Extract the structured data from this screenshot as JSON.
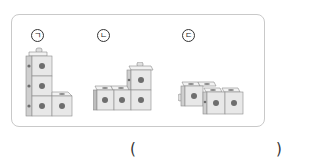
{
  "figures": [
    {
      "label": "ㄱ",
      "description": "L-shaped stack: 3 cubes vertical with 1 cube to the right at bottom"
    },
    {
      "label": "ㄴ",
      "description": "3 cubes horizontal with 1 cube stacked on the rightmost"
    },
    {
      "label": "ㄷ",
      "description": "4 cubes in a staggered zig-zag arrangement"
    }
  ],
  "answer": {
    "open_paren": "(",
    "close_paren": ")",
    "value": ""
  },
  "colors": {
    "frame_border": "#c9c9c9",
    "cube_front": "#e8e8e8",
    "cube_top": "#f2f2f2",
    "cube_side": "#cfcfcf",
    "cube_edge": "#8a8a8a",
    "hole": "#6e6e6e"
  }
}
